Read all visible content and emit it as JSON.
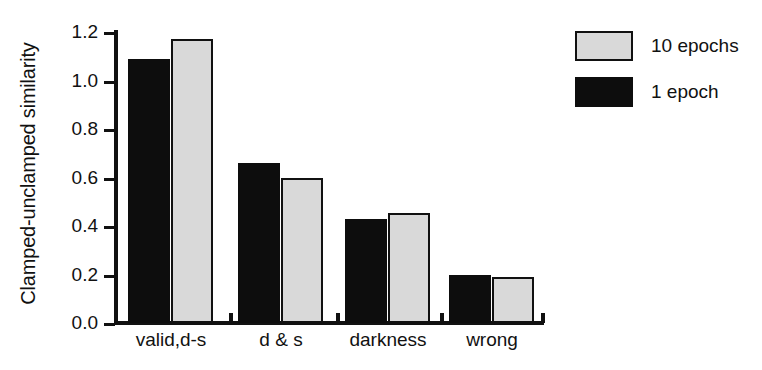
{
  "chart_data": {
    "type": "bar",
    "title": "",
    "xlabel": "",
    "ylabel": "Clamped-unclamped similarity",
    "categories": [
      "valid,d-s",
      "d & s",
      "darkness",
      "wrong"
    ],
    "series": [
      {
        "name": "1 epoch",
        "color": "#0d0d0d",
        "values": [
          1.09,
          0.66,
          0.43,
          0.2
        ]
      },
      {
        "name": "10 epochs",
        "color": "#d9d9d9",
        "values": [
          1.17,
          0.6,
          0.455,
          0.19
        ]
      }
    ],
    "ylim": [
      0.0,
      1.2
    ],
    "ytick_labels": [
      "1.2",
      "1.0",
      "0.8",
      "0.6",
      "0.4",
      "0.2",
      "0.0"
    ],
    "ytick_values": [
      1.2,
      1.0,
      0.8,
      0.6,
      0.4,
      0.2,
      0.0
    ],
    "grid": false,
    "legend_position": "right"
  },
  "legend": {
    "entries": [
      {
        "label": "10 epochs",
        "swatch": "light"
      },
      {
        "label": "1 epoch",
        "swatch": "dark"
      }
    ]
  }
}
